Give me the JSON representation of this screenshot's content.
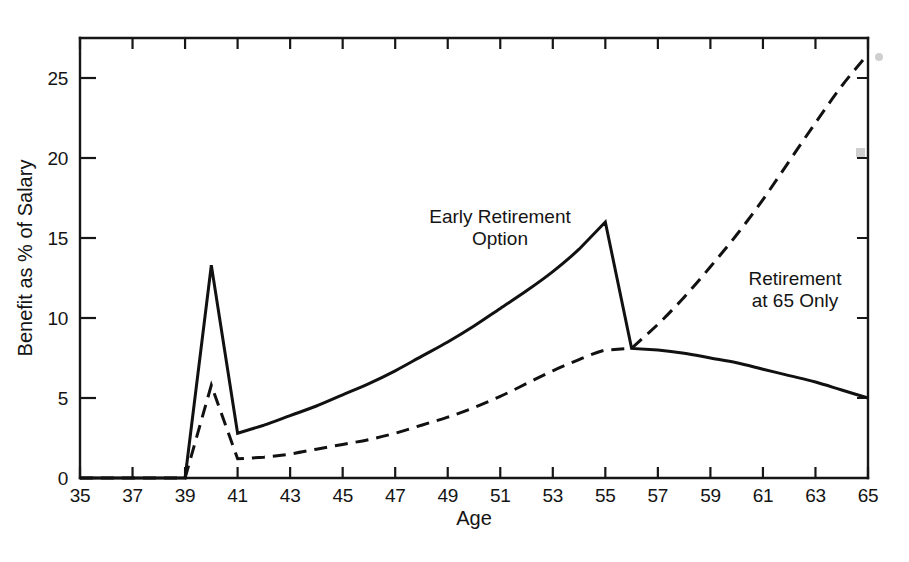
{
  "chart_data": {
    "type": "line",
    "title": "",
    "xlabel": "Age",
    "ylabel": "Benefit as % of Salary",
    "xlim": [
      35,
      65
    ],
    "ylim": [
      0,
      27.5
    ],
    "grid": false,
    "legend_position": "inline-annotations",
    "x_ticks": [
      35,
      37,
      39,
      41,
      43,
      45,
      47,
      49,
      51,
      53,
      55,
      57,
      59,
      61,
      63,
      65
    ],
    "x_tick_labels": [
      "35",
      "37",
      "39",
      "41",
      "43",
      "45",
      "47",
      "49",
      "51",
      "53",
      "55",
      "57",
      "59",
      "61",
      "63",
      "65"
    ],
    "y_ticks": [
      0,
      5,
      10,
      15,
      20,
      25
    ],
    "y_tick_labels": [
      "0",
      "5",
      "10",
      "15",
      "20",
      "25"
    ],
    "series": [
      {
        "name": "Early Retirement Option",
        "style": "solid",
        "annotation_lines": [
          "Early Retirement",
          "Option"
        ],
        "x": [
          35,
          36,
          37,
          38,
          39,
          40,
          41,
          42,
          43,
          44,
          45,
          46,
          47,
          48,
          49,
          50,
          51,
          52,
          53,
          54,
          55,
          56,
          57,
          58,
          59,
          60,
          61,
          62,
          63,
          64,
          65
        ],
        "values": [
          0,
          0,
          0,
          0,
          0,
          13.3,
          2.8,
          3.3,
          3.9,
          4.5,
          5.2,
          5.9,
          6.7,
          7.6,
          8.5,
          9.5,
          10.6,
          11.7,
          12.9,
          14.3,
          16.0,
          8.1,
          8.0,
          7.8,
          7.5,
          7.2,
          6.8,
          6.4,
          6.0,
          5.5,
          5.0
        ]
      },
      {
        "name": "Retirement at 65 Only",
        "style": "dashed",
        "annotation_lines": [
          "Retirement",
          "at 65 Only"
        ],
        "x": [
          35,
          36,
          37,
          38,
          39,
          40,
          41,
          42,
          43,
          44,
          45,
          46,
          47,
          48,
          49,
          50,
          51,
          52,
          53,
          54,
          55,
          56,
          57,
          58,
          59,
          60,
          61,
          62,
          63,
          64,
          65
        ],
        "values": [
          0,
          0,
          0,
          0,
          0,
          5.8,
          1.2,
          1.3,
          1.5,
          1.8,
          2.1,
          2.4,
          2.8,
          3.3,
          3.8,
          4.4,
          5.1,
          5.9,
          6.7,
          7.4,
          8.0,
          8.1,
          9.6,
          11.3,
          13.2,
          15.2,
          17.4,
          19.8,
          22.2,
          24.5,
          26.5
        ]
      }
    ],
    "annotations": [
      {
        "id": "early-retirement-option",
        "lines": [
          "Early Retirement",
          "Option"
        ],
        "anchor_x": 48.5,
        "anchor_y": 17.8
      },
      {
        "id": "retirement-at-65-only",
        "lines": [
          "Retirement",
          "at 65 Only"
        ],
        "anchor_x": 60.0,
        "anchor_y": 13.0
      }
    ],
    "colors": {
      "ink": "#111111",
      "background": "#ffffff"
    }
  }
}
